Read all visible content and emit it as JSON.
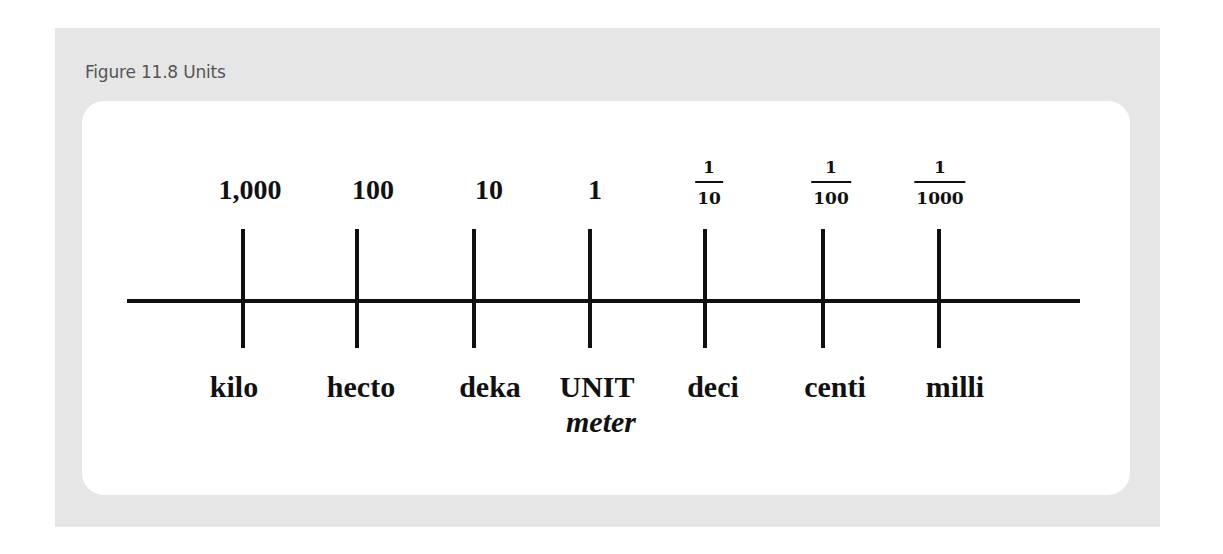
{
  "figure": {
    "title": "Figure 11.8 Units"
  },
  "scale": {
    "values": [
      {
        "type": "number",
        "text": "1,000"
      },
      {
        "type": "number",
        "text": "100"
      },
      {
        "type": "number",
        "text": "10"
      },
      {
        "type": "number",
        "text": "1"
      },
      {
        "type": "fraction",
        "numerator": "1",
        "denominator": "10"
      },
      {
        "type": "fraction",
        "numerator": "1",
        "denominator": "100"
      },
      {
        "type": "fraction",
        "numerator": "1",
        "denominator": "1000"
      }
    ],
    "prefixes": [
      "kilo",
      "hecto",
      "deka",
      "UNIT",
      "deci",
      "centi",
      "milli"
    ],
    "unit_name": "meter"
  },
  "colors": {
    "panel_bg": "#e6e6e6",
    "card_bg": "#ffffff",
    "line": "#111111",
    "title_text": "#555555"
  }
}
